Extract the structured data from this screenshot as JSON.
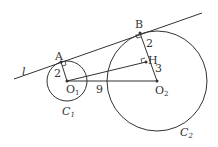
{
  "diagram": {
    "line_label": "l",
    "points": {
      "A": "A",
      "B": "B",
      "H": "H",
      "O1": "O",
      "O2": "O"
    },
    "subscripts": {
      "O1": "1",
      "O2": "2",
      "C1": "1",
      "C2": "2"
    },
    "circles": {
      "C1": "C",
      "C2": "C"
    },
    "lengths": {
      "AO1": "2",
      "BH": "2",
      "HO2": "3",
      "O1O2": "9"
    },
    "stroke_color": "#333333"
  }
}
